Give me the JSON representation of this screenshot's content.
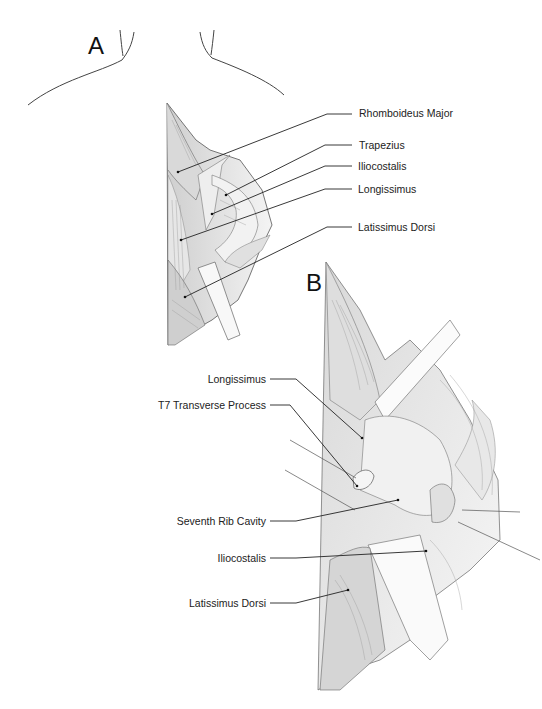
{
  "figure": {
    "panels": [
      {
        "letter": "A",
        "labels": [
          {
            "text": "Rhomboideus Major"
          },
          {
            "text": "Trapezius"
          },
          {
            "text": "Iliocostalis"
          },
          {
            "text": "Longissimus"
          },
          {
            "text": "Latissimus Dorsi"
          }
        ]
      },
      {
        "letter": "B",
        "labels": [
          {
            "text": "Longissimus"
          },
          {
            "text": "T7 Transverse Process"
          },
          {
            "text": "Seventh Rib Cavity"
          },
          {
            "text": "Iliocostalis"
          },
          {
            "text": "Latissimus Dorsi"
          }
        ]
      }
    ]
  }
}
